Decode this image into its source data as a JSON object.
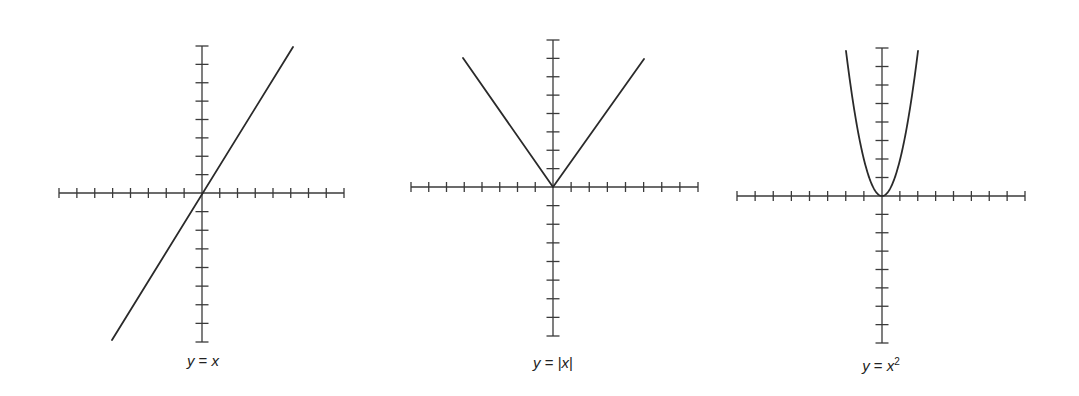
{
  "chart_data": [
    {
      "type": "line",
      "title": "y = x",
      "function": "y = x",
      "x_range": [
        -8,
        8
      ],
      "y_range": [
        -8,
        8
      ],
      "x_ticks_each_side": 8,
      "y_ticks_each_side": 8,
      "grid": false,
      "tick_labels": false,
      "series": [
        {
          "name": "y = x",
          "x": [
            -8,
            8
          ],
          "y": [
            -8,
            8
          ]
        }
      ]
    },
    {
      "type": "line",
      "title": "y = |x|",
      "function": "y = |x|",
      "x_range": [
        -8,
        8
      ],
      "y_range": [
        -8,
        8
      ],
      "x_ticks_each_side": 8,
      "y_ticks_each_side": 8,
      "grid": false,
      "tick_labels": false,
      "series": [
        {
          "name": "y = |x|",
          "x": [
            -5,
            0,
            5
          ],
          "y": [
            7,
            0,
            7
          ]
        }
      ]
    },
    {
      "type": "line",
      "title": "y = x²",
      "function": "y = x^2",
      "x_range": [
        -8,
        8
      ],
      "y_range": [
        -8,
        8
      ],
      "x_ticks_each_side": 8,
      "y_ticks_each_side": 8,
      "grid": false,
      "tick_labels": false,
      "series": [
        {
          "name": "y = x^2",
          "x": [
            -2,
            -1,
            0,
            1,
            2
          ],
          "y": [
            8,
            2,
            0,
            2,
            8
          ]
        }
      ]
    }
  ],
  "graphs": [
    {
      "id": "linear",
      "label_var": "y",
      "label_eq": " = ",
      "label_rhs": "x",
      "label_sup": "",
      "label_abs": false,
      "label_pos": [
        203,
        360
      ],
      "origin": [
        202,
        193
      ],
      "x_extent": [
        59,
        344
      ],
      "y_extent": [
        46,
        342
      ],
      "ticks": 8,
      "curve": {
        "kind": "polyline",
        "points": [
          [
            112,
            340
          ],
          [
            293,
            47
          ]
        ]
      }
    },
    {
      "id": "absolute",
      "label_var": "y",
      "label_eq": " = ",
      "label_rhs": "x",
      "label_sup": "",
      "label_abs": true,
      "label_pos": [
        553,
        362
      ],
      "origin": [
        553,
        187
      ],
      "x_extent": [
        411,
        698
      ],
      "y_extent": [
        40,
        336
      ],
      "ticks": 8,
      "curve": {
        "kind": "polyline",
        "points": [
          [
            463,
            58
          ],
          [
            553,
            187
          ],
          [
            644,
            59
          ]
        ]
      }
    },
    {
      "id": "quadratic",
      "label_var": "y",
      "label_eq": " = ",
      "label_rhs": "x",
      "label_sup": "2",
      "label_abs": false,
      "label_pos": [
        881,
        365
      ],
      "origin": [
        882,
        196
      ],
      "x_extent": [
        737,
        1025
      ],
      "y_extent": [
        48,
        343
      ],
      "ticks": 8,
      "curve": {
        "kind": "parabola",
        "half_width": 36,
        "height": 145
      }
    }
  ],
  "style": {
    "axis_color": "#3a3a3a",
    "curve_color": "#2a2a2a",
    "background": "#ffffff"
  }
}
